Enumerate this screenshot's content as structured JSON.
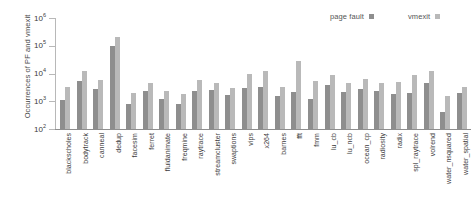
{
  "chart_data": {
    "type": "bar",
    "title": "",
    "xlabel": "",
    "ylabel": "Occurrences of PF and vmexit",
    "yscale": "log",
    "ylim": [
      100,
      1000000
    ],
    "ytick_labels": [
      "10^6",
      "10^5",
      "10^4",
      "10^3",
      "10^2"
    ],
    "ytick_mantissa": "10",
    "ytick_exponents": [
      "6",
      "5",
      "4",
      "3",
      "2"
    ],
    "grid": false,
    "legend_position": "top-right",
    "categories": [
      "blackscholes",
      "bodytrack",
      "canneal",
      "dedup",
      "facesim",
      "ferret",
      "fluidanimate",
      "freqmine",
      "raytrace",
      "streamcluster",
      "swaptions",
      "vips",
      "x264",
      "barnes",
      "fft",
      "fmm",
      "lu_cb",
      "lu_ncb",
      "ocean_cp",
      "radiosity",
      "radix",
      "spl_raytrace",
      "volrend",
      "water_nsquared",
      "water_spatial"
    ],
    "series": [
      {
        "name": "page fault",
        "color": "#8e8e8e",
        "values": [
          1150,
          5400,
          2700,
          100000,
          800,
          2400,
          1250,
          780,
          2350,
          2600,
          1700,
          2900,
          3400,
          1600,
          2100,
          1200,
          3700,
          2200,
          2800,
          2400,
          1800,
          2000,
          4500,
          420,
          2000
        ]
      },
      {
        "name": "vmexit",
        "color": "#b9b9b9",
        "values": [
          3400,
          12000,
          6000,
          210000,
          2000,
          4400,
          2300,
          1900,
          5700,
          4700,
          3000,
          9500,
          12000,
          3400,
          28000,
          5400,
          8500,
          4500,
          6300,
          4400,
          5000,
          9000,
          12000,
          1600,
          3300
        ]
      }
    ]
  },
  "legend": {
    "entries": [
      {
        "label": "page fault",
        "color": "#8e8e8e"
      },
      {
        "label": "vmexit",
        "color": "#b9b9b9"
      }
    ]
  }
}
